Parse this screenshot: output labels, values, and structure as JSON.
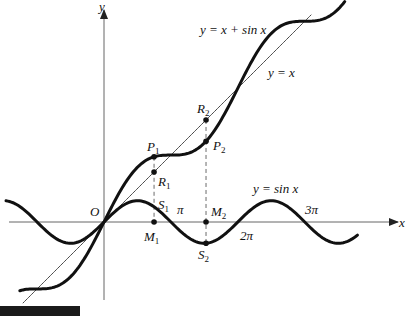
{
  "figure": {
    "caption_tag": "Figure 3.17",
    "axes": {
      "x_label": "x",
      "y_label": "y",
      "origin_label": "O",
      "origin_px": [
        104,
        222
      ],
      "px_per_unit": 21.3,
      "x_axis_px": [
        9,
        398
      ],
      "y_axis_px": [
        300,
        10
      ]
    },
    "curves": [
      {
        "name": "y = x + sin x",
        "kind": "x_plus_sin",
        "x_range": [
          -3.95,
          11.3
        ],
        "stroke": "#111111",
        "width": 3,
        "label": "y = x + sin x",
        "label_pos": [
          200,
          34
        ]
      },
      {
        "name": "y = x",
        "kind": "identity",
        "x_range": [
          -3.8,
          9.72
        ],
        "stroke": "#333333",
        "width": 0.9,
        "label": "y = x",
        "label_pos": [
          268,
          77
        ]
      },
      {
        "name": "y = sin x",
        "kind": "sin",
        "x_range": [
          -4.6,
          11.9
        ],
        "stroke": "#111111",
        "width": 3,
        "label": "y = sin x",
        "label_pos": [
          253,
          193
        ]
      }
    ],
    "tick_labels": [
      {
        "text": "π",
        "pos": [
          177,
          214
        ]
      },
      {
        "text": "2π",
        "pos": [
          240,
          240
        ]
      },
      {
        "text": "3π",
        "pos": [
          305,
          214
        ]
      }
    ],
    "points": [
      {
        "name": "P",
        "sub": "1",
        "x": 2.35,
        "curve": "x_plus_sin",
        "label_pos": [
          147,
          151
        ]
      },
      {
        "name": "R",
        "sub": "1",
        "x": 2.35,
        "curve": "identity",
        "label_pos": [
          158,
          186
        ]
      },
      {
        "name": "S",
        "sub": "1",
        "x": 2.35,
        "curve": "sin",
        "label_pos": [
          158,
          209
        ],
        "nodot": true
      },
      {
        "name": "M",
        "sub": "1",
        "x": 2.35,
        "curve": "axis",
        "label_pos": [
          144,
          241
        ]
      },
      {
        "name": "R",
        "sub": "2",
        "x": 4.79,
        "curve": "identity",
        "label_pos": [
          197,
          113
        ]
      },
      {
        "name": "P",
        "sub": "2",
        "x": 4.79,
        "curve": "x_plus_sin",
        "label_pos": [
          213,
          150
        ]
      },
      {
        "name": "M",
        "sub": "2",
        "x": 4.79,
        "curve": "axis",
        "label_pos": [
          211,
          216
        ]
      },
      {
        "name": "S",
        "sub": "2",
        "x": 4.79,
        "curve": "sin",
        "label_pos": [
          198,
          259
        ]
      }
    ],
    "verticals": [
      {
        "x": 2.35,
        "from": "x_plus_sin",
        "to": "axis",
        "style": "dashed-from-sin"
      },
      {
        "x": 4.79,
        "from": "identity",
        "to": "sin",
        "style": "dashed"
      }
    ]
  },
  "chart_data": {
    "type": "line",
    "title": "",
    "xlabel": "x",
    "ylabel": "y",
    "series": [
      {
        "name": "y = x + sin x",
        "function": "x + sin(x)",
        "x_range": [
          -3.95,
          11.3
        ]
      },
      {
        "name": "y = x",
        "function": "x",
        "x_range": [
          -3.8,
          9.72
        ]
      },
      {
        "name": "y = sin x",
        "function": "sin(x)",
        "x_range": [
          -4.6,
          11.9
        ]
      }
    ],
    "x_ticks": [
      "π",
      "2π",
      "3π"
    ],
    "annotations": [
      "O",
      "P1",
      "R1",
      "S1",
      "M1",
      "P2",
      "R2",
      "M2",
      "S2"
    ],
    "grid": false
  }
}
